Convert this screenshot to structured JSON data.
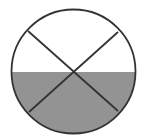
{
  "diagram": {
    "type": "fraction-circle",
    "total_parts": 4,
    "shaded_parts": 2,
    "shaded_region": "bottom-half",
    "colors": {
      "background": "#ffffff",
      "outline": "#333333",
      "shade": "#939393"
    },
    "geometry": {
      "center_x": 73.5,
      "center_y": 71.5,
      "radius": 62,
      "stroke_width": 1.8,
      "shade_top_y": 72,
      "lines": [
        {
          "x1": 28,
          "y1": 31,
          "x2": 118,
          "y2": 111
        },
        {
          "x1": 118,
          "y1": 32,
          "x2": 29,
          "y2": 112
        }
      ]
    }
  }
}
